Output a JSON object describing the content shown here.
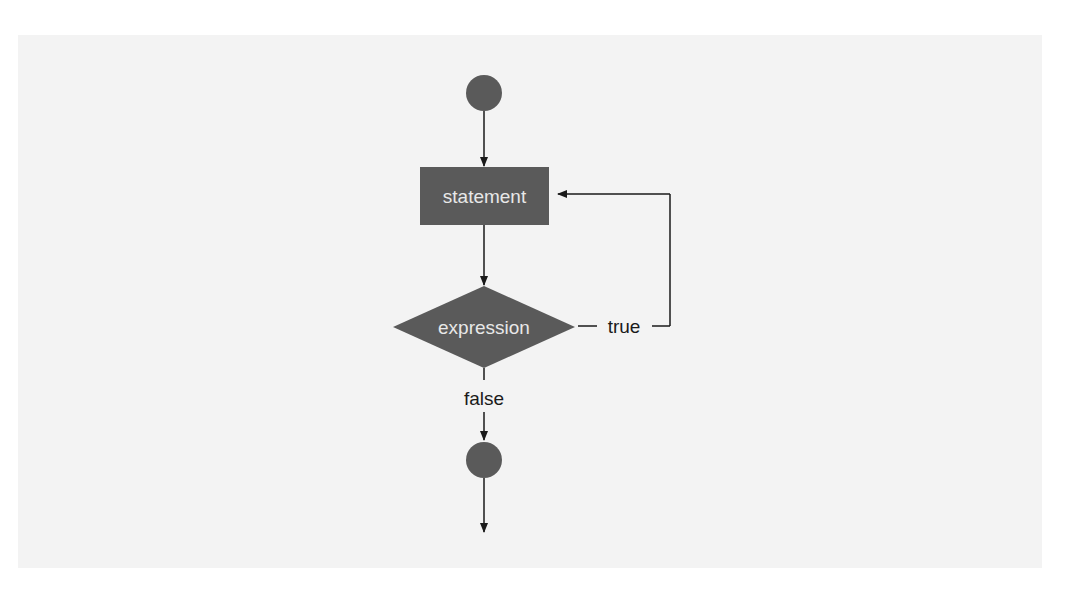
{
  "diagram": {
    "type": "flowchart",
    "colors": {
      "background": "#f3f3f3",
      "node_fill": "#5a5a5a",
      "node_text": "#e8e8e8",
      "line": "#1a1a1a",
      "edge_text": "#1a1a1a"
    },
    "nodes": {
      "start": {
        "kind": "initial-state"
      },
      "statement": {
        "kind": "action",
        "label": "statement"
      },
      "expression": {
        "kind": "decision",
        "label": "expression"
      },
      "end": {
        "kind": "final-state"
      }
    },
    "edges": [
      {
        "from": "start",
        "to": "statement",
        "label": ""
      },
      {
        "from": "statement",
        "to": "expression",
        "label": ""
      },
      {
        "from": "expression",
        "to": "statement",
        "label": "true"
      },
      {
        "from": "expression",
        "to": "end",
        "label": "false"
      },
      {
        "from": "end",
        "to": "exit",
        "label": ""
      }
    ],
    "labels": {
      "true": "true",
      "false": "false"
    }
  }
}
